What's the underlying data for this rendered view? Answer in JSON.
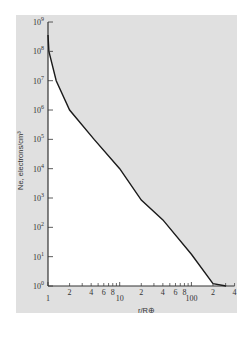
{
  "chart_data": {
    "type": "line",
    "title": "",
    "xlabel": "r/R⊕",
    "ylabel": "Ne, electrons/cm³",
    "x_scale": "log",
    "y_scale": "log",
    "xlim": [
      1,
      400
    ],
    "ylim": [
      1,
      1000000000
    ],
    "grid": false,
    "legend": null,
    "x_ticks_major": [
      {
        "value": 1,
        "label": "1"
      },
      {
        "value": 10,
        "label": "10"
      },
      {
        "value": 100,
        "label": "100"
      }
    ],
    "x_ticks_minor": [
      {
        "value": 2,
        "label": "2"
      },
      {
        "value": 4,
        "label": "4"
      },
      {
        "value": 6,
        "label": "6"
      },
      {
        "value": 8,
        "label": "8"
      },
      {
        "value": 20,
        "label": "2"
      },
      {
        "value": 40,
        "label": "4"
      },
      {
        "value": 60,
        "label": "6"
      },
      {
        "value": 80,
        "label": "8"
      },
      {
        "value": 200,
        "label": "2"
      },
      {
        "value": 400,
        "label": "4"
      }
    ],
    "y_ticks": [
      {
        "exp": 0,
        "label": "10",
        "sup": "0"
      },
      {
        "exp": 1,
        "label": "10",
        "sup": "1"
      },
      {
        "exp": 2,
        "label": "10",
        "sup": "2"
      },
      {
        "exp": 3,
        "label": "10",
        "sup": "3"
      },
      {
        "exp": 4,
        "label": "10",
        "sup": "4"
      },
      {
        "exp": 5,
        "label": "10",
        "sup": "5"
      },
      {
        "exp": 6,
        "label": "10",
        "sup": "6"
      },
      {
        "exp": 7,
        "label": "10",
        "sup": "7"
      },
      {
        "exp": 8,
        "label": "10",
        "sup": "8"
      },
      {
        "exp": 9,
        "label": "10",
        "sup": "9"
      }
    ],
    "series": [
      {
        "name": "Electron density",
        "x": [
          1.0,
          1.03,
          1.3,
          2.0,
          4.4,
          10,
          20,
          40,
          100,
          200,
          305
        ],
        "y": [
          360000000,
          100000000,
          10000000,
          1000000,
          100000,
          10000,
          850,
          180,
          12,
          1.2,
          1
        ]
      }
    ],
    "colors": {
      "panel": "#e0e0e0",
      "under_curve": "#ffffff",
      "line": "#1a1a1a",
      "background": "#ffffff"
    }
  }
}
